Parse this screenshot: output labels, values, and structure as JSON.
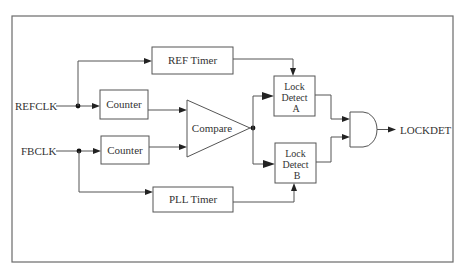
{
  "diagram": {
    "title": "",
    "inputs": {
      "refclk": "REFCLK",
      "fbclk": "FBCLK"
    },
    "blocks": {
      "ref_timer": "REF Timer",
      "pll_timer": "PLL Timer",
      "counter_ref": "Counter",
      "counter_fb": "Counter",
      "compare": "Compare",
      "lock_detect_a": {
        "line1": "Lock",
        "line2": "Detect",
        "line3": "A"
      },
      "lock_detect_b": {
        "line1": "Lock",
        "line2": "Detect",
        "line3": "B"
      },
      "and_gate": "AND"
    },
    "outputs": {
      "lockdet": "LOCKDET"
    },
    "colors": {
      "line": "#555555",
      "text": "#333333",
      "frame": "#6a6a6a",
      "background": "#ffffff"
    }
  }
}
